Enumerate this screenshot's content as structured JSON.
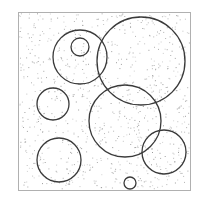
{
  "figure": {
    "frame": {
      "x": 18,
      "y": 12,
      "width": 172,
      "height": 178,
      "stroke": "#b0b0b0"
    },
    "circle_stroke": "#3a3a3a",
    "dot_color": "#8a8a8a",
    "circles": [
      {
        "id": "A",
        "cx": 80,
        "cy": 57,
        "r": 27
      },
      {
        "id": "B",
        "cx": 80,
        "cy": 47,
        "r": 9
      },
      {
        "id": "C",
        "cx": 141,
        "cy": 61,
        "r": 44
      },
      {
        "id": "D",
        "cx": 53,
        "cy": 104,
        "r": 16
      },
      {
        "id": "E",
        "cx": 125,
        "cy": 121,
        "r": 36
      },
      {
        "id": "F",
        "cx": 59,
        "cy": 160,
        "r": 22
      },
      {
        "id": "G",
        "cx": 164,
        "cy": 152,
        "r": 22
      },
      {
        "id": "H",
        "cx": 130,
        "cy": 183,
        "r": 6
      }
    ],
    "noise_points": 900
  }
}
